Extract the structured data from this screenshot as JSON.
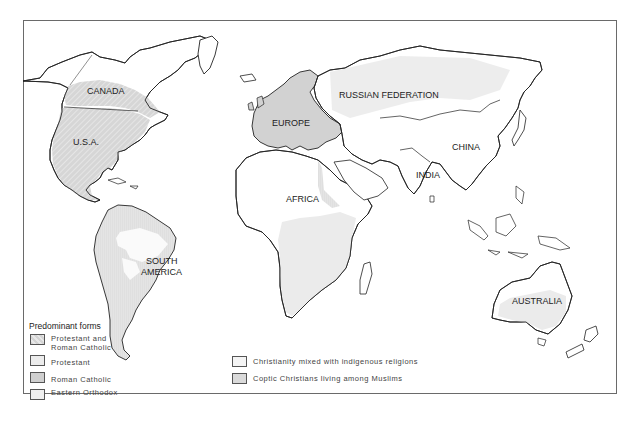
{
  "map": {
    "type": "choropleth world map",
    "subject": "Predominant forms of Christianity",
    "region_labels": [
      {
        "id": "canada",
        "text": "CANADA"
      },
      {
        "id": "usa",
        "text": "U.S.A."
      },
      {
        "id": "europe",
        "text": "EUROPE"
      },
      {
        "id": "russia",
        "text": "RUSSIAN FEDERATION"
      },
      {
        "id": "china",
        "text": "CHINA"
      },
      {
        "id": "india",
        "text": "INDIA"
      },
      {
        "id": "africa",
        "text": "AFRICA"
      },
      {
        "id": "south_america_1",
        "text": "SOUTH"
      },
      {
        "id": "south_america_2",
        "text": "AMERICA"
      },
      {
        "id": "australia",
        "text": "AUSTRALIA"
      }
    ]
  },
  "legend": {
    "title": "Predominant forms",
    "items": [
      {
        "label_line1": "Protestant and",
        "label_line2": "Roman Catholic",
        "pattern": "hatched",
        "color": "#d4d4d4"
      },
      {
        "label_line1": "Protestant",
        "label_line2": "",
        "pattern": "solid",
        "color": "#ececec"
      },
      {
        "label_line1": "Roman Catholic",
        "label_line2": "",
        "pattern": "solid",
        "color": "#cfcfcf"
      },
      {
        "label_line1": "Eastern Orthodox",
        "label_line2": "",
        "pattern": "solid",
        "color": "#efefef"
      },
      {
        "label_line1": "Christianity mixed with indigenous religions",
        "label_line2": "",
        "pattern": "solid",
        "color": "#f4f4f4"
      },
      {
        "label_line1": "Coptic Christians living among Muslims",
        "label_line2": "",
        "pattern": "solid",
        "color": "#dadada"
      }
    ]
  },
  "colors": {
    "outline": "#222222",
    "frame": "#6a6a6a",
    "land": "#ffffff"
  }
}
